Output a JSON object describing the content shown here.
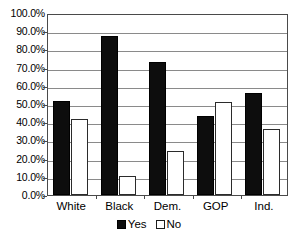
{
  "chart_data": {
    "type": "bar",
    "title": "",
    "subtitle": "",
    "xlabel": "",
    "ylabel": "",
    "categories": [
      "White",
      "Black",
      "Dem.",
      "GOP",
      "Ind."
    ],
    "series": [
      {
        "name": "Yes",
        "color": "#0d0d0d",
        "values": [
          51.8,
          87.5,
          73.0,
          43.5,
          56.0
        ]
      },
      {
        "name": "No",
        "color": "#ffffff",
        "values": [
          41.5,
          10.5,
          24.0,
          51.0,
          36.0
        ]
      }
    ],
    "ylim": [
      0,
      100
    ],
    "ytick_step": 10,
    "ytick_labels": [
      "0.0%",
      "10.0%",
      "20.0%",
      "30.0%",
      "40.0%",
      "50.0%",
      "60.0%",
      "70.0%",
      "80.0%",
      "90.0%",
      "100.0%"
    ],
    "grid": true,
    "grid_axis": "y",
    "legend": true,
    "legend_position": "bottom",
    "legend_entries": [
      "Yes",
      "No"
    ]
  },
  "axis": {
    "y": {
      "ticks": [
        {
          "label": "100.0%",
          "value": 100
        },
        {
          "label": "90.0%",
          "value": 90
        },
        {
          "label": "80.0%",
          "value": 80
        },
        {
          "label": "70.0%",
          "value": 70
        },
        {
          "label": "60.0%",
          "value": 60
        },
        {
          "label": "50.0%",
          "value": 50
        },
        {
          "label": "40.0%",
          "value": 40
        },
        {
          "label": "30.0%",
          "value": 30
        },
        {
          "label": "20.0%",
          "value": 20
        },
        {
          "label": "10.0%",
          "value": 10
        },
        {
          "label": "0.0%",
          "value": 0
        }
      ]
    },
    "x": {
      "categories": [
        "White",
        "Black",
        "Dem.",
        "GOP",
        "Ind."
      ]
    }
  },
  "legend": {
    "items": [
      {
        "label": "Yes",
        "swatch": "filled-black-square"
      },
      {
        "label": "No",
        "swatch": "outlined-white-square"
      }
    ]
  },
  "colors": {
    "yes": "#0d0d0d",
    "no": "#ffffff",
    "frame": "#4a4a4a",
    "gridline": "#8a8a8a",
    "background": "#ffffff"
  }
}
